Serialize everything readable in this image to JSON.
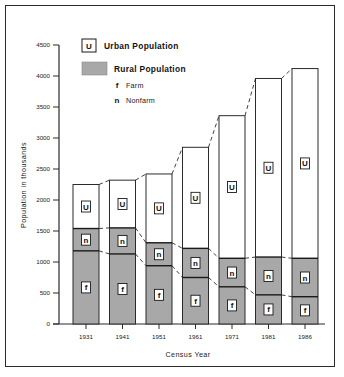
{
  "chart_data": {
    "type": "bar",
    "title": "",
    "subtitle": "",
    "xlabel": "Census Year",
    "ylabel": "Population in thousands",
    "categories": [
      "1931",
      "1941",
      "1951",
      "1961",
      "1971",
      "1981",
      "1986"
    ],
    "ylim": [
      0,
      4500
    ],
    "yticks": [
      0,
      500,
      1000,
      1500,
      2000,
      2500,
      3000,
      3500,
      4000,
      4500
    ],
    "ytick_labels": [
      "0",
      "500",
      "1000",
      "1500",
      "2000",
      "2500",
      "3000",
      "3500",
      "4000",
      "4500"
    ],
    "grid": false,
    "stacked": true,
    "legend_position": "upper-left-inside",
    "series": [
      {
        "name": "Farm",
        "glyph": "f",
        "color": "#a8a8a8",
        "values": [
          1180,
          1130,
          940,
          750,
          600,
          470,
          440
        ]
      },
      {
        "name": "Nonfarm",
        "glyph": "n",
        "color": "#a8a8a8",
        "values": [
          360,
          420,
          370,
          470,
          460,
          610,
          620
        ]
      },
      {
        "name": "Urban Population",
        "glyph": "U",
        "color": "#ffffff",
        "values": [
          710,
          770,
          1110,
          1630,
          2300,
          2880,
          3060
        ]
      }
    ],
    "cumulative": {
      "farm_top": [
        1180,
        1130,
        940,
        750,
        600,
        470,
        440
      ],
      "rural_top": [
        1540,
        1550,
        1310,
        1220,
        1060,
        1080,
        1060
      ],
      "total_top": [
        2250,
        2320,
        2420,
        2850,
        3360,
        3960,
        4120
      ]
    },
    "annotations": [
      "Dashed connector lines link the tops of consecutive bars",
      "Dashed connector lines link the rural (nonfarm) tops of consecutive bars",
      "Dashed connector lines link the farm tops of consecutive bars"
    ]
  },
  "legend": {
    "urban": {
      "glyph": "U",
      "label": "Urban Population"
    },
    "rural": {
      "label": "Rural Population",
      "sub_items": [
        {
          "glyph": "f",
          "label": "Farm"
        },
        {
          "glyph": "n",
          "label": "Nonfarm"
        }
      ]
    }
  },
  "colors": {
    "rural_fill": "#a8a8a8",
    "urban_fill": "#ffffff",
    "ink": "#2b2b2b",
    "background": "#ffffff"
  }
}
